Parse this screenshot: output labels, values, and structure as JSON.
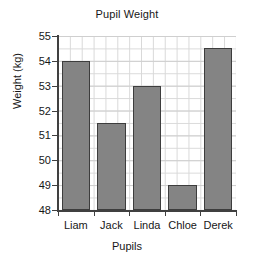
{
  "chart_data": {
    "type": "bar",
    "title": "Pupil Weight",
    "xlabel": "Pupils",
    "ylabel": "Weight (kg)",
    "categories": [
      "Liam",
      "Jack",
      "Linda",
      "Chloe",
      "Derek"
    ],
    "values": [
      54,
      51.5,
      53,
      49,
      54.5
    ],
    "ylim": [
      48,
      55
    ],
    "ytick_labels": [
      "48",
      "49",
      "50",
      "51",
      "52",
      "53",
      "54",
      "55"
    ],
    "ytick_values": [
      48,
      49,
      50,
      51,
      52,
      53,
      54,
      55
    ],
    "grid": true,
    "minor_grid_step": 0.5,
    "legend": "none",
    "bar_color": "#848484",
    "bar_edge_color": "#3d3d3d",
    "grid_color": "#d9d9d9",
    "axis_color": "#404040",
    "background_color": "#ffffff"
  }
}
